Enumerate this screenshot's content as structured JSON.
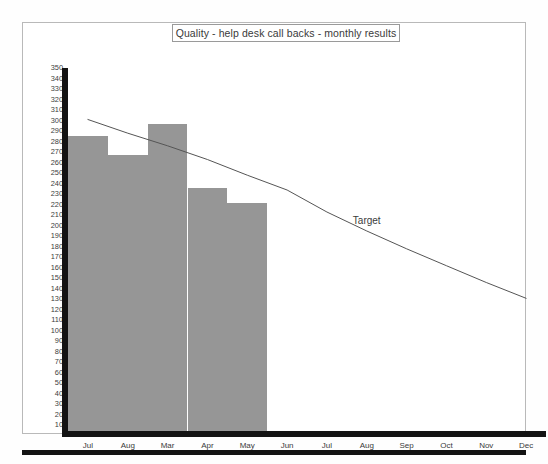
{
  "chart_data": {
    "type": "bar",
    "title": "Quality - help desk call backs - monthly results",
    "xlabel": "",
    "ylabel": "",
    "ylim": [
      0,
      350
    ],
    "ytick_step": 10,
    "grid": false,
    "legend_position": "inline-annotation",
    "categories": [
      "Jul",
      "Aug",
      "Mar",
      "Apr",
      "May",
      "Jun",
      "Jul",
      "Aug",
      "Sep",
      "Oct",
      "Nov",
      "Dec"
    ],
    "yticks": [
      350,
      340,
      330,
      320,
      310,
      300,
      290,
      280,
      270,
      260,
      250,
      240,
      230,
      220,
      210,
      200,
      190,
      180,
      170,
      160,
      150,
      140,
      130,
      120,
      110,
      100,
      90,
      80,
      70,
      60,
      50,
      40,
      30,
      20,
      10
    ],
    "series": [
      {
        "name": "Actual",
        "type": "bar",
        "color": "#969696",
        "values": [
          285,
          267,
          297,
          236,
          222,
          null,
          null,
          null,
          null,
          null,
          null,
          null
        ]
      },
      {
        "name": "Target",
        "type": "line",
        "color": "#555555",
        "values": [
          301,
          288,
          276,
          263,
          248,
          234,
          213,
          195,
          178,
          162,
          146,
          131
        ]
      }
    ],
    "annotations": [
      {
        "text": "Target",
        "category_index": 7,
        "value": 205
      }
    ]
  },
  "chart": {
    "title": "Quality - help desk call backs - monthly results",
    "target_label": "Target"
  }
}
